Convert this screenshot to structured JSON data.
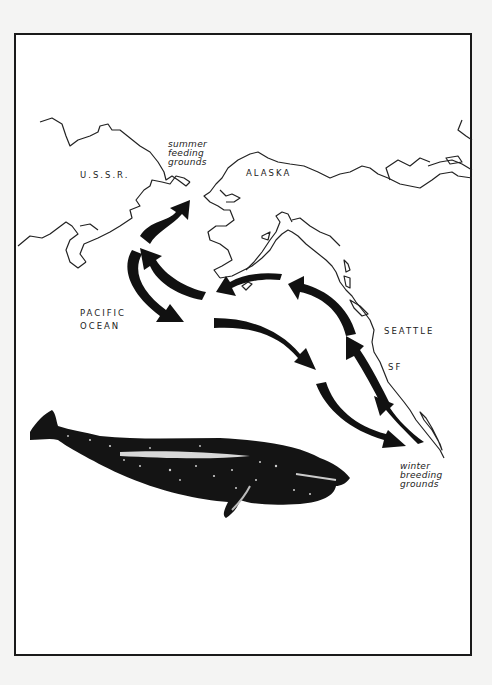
{
  "map": {
    "title": "Gray whale migration route",
    "regions": {
      "ussr": "U.S.S.R.",
      "alaska": "ALASKA",
      "pacific_line1": "PACIFIC",
      "pacific_line2": "OCEAN",
      "seattle": "SEATTLE",
      "sf": "SF"
    },
    "annotations": {
      "summer": [
        "summer",
        "feeding",
        "grounds"
      ],
      "winter": [
        "winter",
        "breeding",
        "grounds"
      ]
    },
    "colors": {
      "background": "#f4f4f3",
      "paper": "#ffffff",
      "ink": "#111111"
    }
  }
}
